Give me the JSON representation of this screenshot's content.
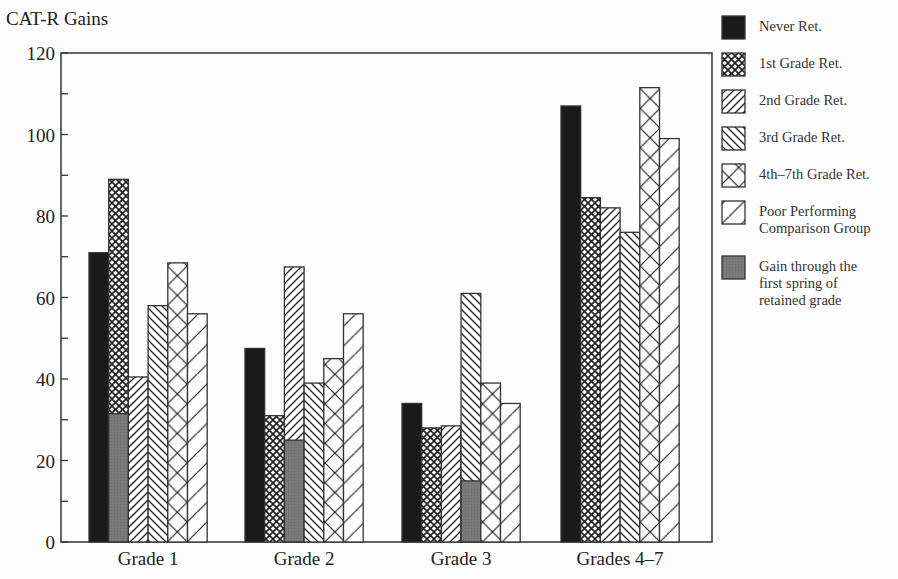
{
  "chart_data": {
    "type": "bar",
    "title": "",
    "ylabel": "CAT-R Gains",
    "xlabel": "",
    "ylim": [
      0,
      120
    ],
    "yticks": [
      0,
      20,
      40,
      60,
      80,
      100,
      120
    ],
    "minor_yticks_every": 10,
    "grid": false,
    "legend_position": "right",
    "categories": [
      "Grade 1",
      "Grade 2",
      "Grade 3",
      "Grades 4–7"
    ],
    "series": [
      {
        "name": "Never Ret.",
        "pattern": "solid-black",
        "values": [
          71,
          47.5,
          34,
          107
        ]
      },
      {
        "name": "1st Grade Ret.",
        "pattern": "crosshatch-fine",
        "values": [
          89,
          31,
          28,
          84.5
        ]
      },
      {
        "name": "2nd Grade Ret.",
        "pattern": "diagonal-forward",
        "values": [
          40.5,
          67.5,
          28.5,
          82
        ]
      },
      {
        "name": "3rd Grade Ret.",
        "pattern": "diagonal-backward",
        "values": [
          58,
          39,
          61,
          76
        ]
      },
      {
        "name": "4th–7th Grade Ret.",
        "pattern": "crosshatch-wide",
        "values": [
          68.5,
          45,
          39,
          111.5
        ]
      },
      {
        "name": "Poor Performing Comparison Group",
        "pattern": "diagonal-forward-wide",
        "values": [
          56,
          56,
          34,
          99
        ]
      }
    ],
    "overlay": {
      "name": "Gain through the first spring of retained grade",
      "pattern": "solid-gray",
      "points": [
        {
          "category": "Grade 1",
          "series": "1st Grade Ret.",
          "value": 31.5
        },
        {
          "category": "Grade 2",
          "series": "2nd Grade Ret.",
          "value": 25
        },
        {
          "category": "Grade 3",
          "series": "3rd Grade Ret.",
          "value": 15
        }
      ]
    }
  },
  "legend": {
    "items": [
      {
        "label": "Never Ret.",
        "pattern": "solid-black"
      },
      {
        "label": "1st Grade Ret.",
        "pattern": "crosshatch-fine"
      },
      {
        "label": "2nd Grade Ret.",
        "pattern": "diagonal-forward"
      },
      {
        "label": "3rd Grade Ret.",
        "pattern": "diagonal-backward"
      },
      {
        "label": "4th–7th Grade Ret.",
        "pattern": "crosshatch-wide"
      },
      {
        "label": "Poor Performing\nComparison Group",
        "pattern": "diagonal-forward-wide"
      },
      {
        "label": "Gain through the\nfirst spring of\nretained grade",
        "pattern": "solid-gray"
      }
    ]
  },
  "colors": {
    "black": "#1a1a1a",
    "gray": "#7a7a7a",
    "line": "#333333",
    "background": "#fdfdfd"
  }
}
